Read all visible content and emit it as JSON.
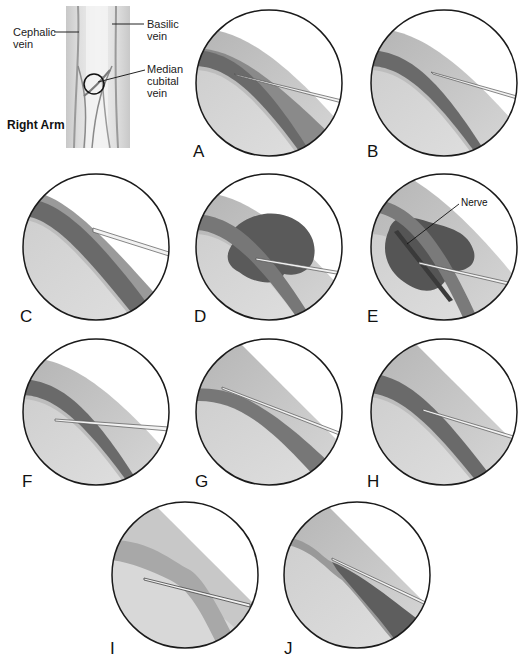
{
  "figure": {
    "arm_diagram": {
      "title": "Right Arm",
      "callouts": {
        "cephalic": "Cephalic\nvein",
        "cephalic_line1": "Cephalic",
        "cephalic_line2": "vein",
        "basilic_line1": "Basilic",
        "basilic_line2": "vein",
        "median_line1": "Median",
        "median_line2": "cubital",
        "median_line3": "vein"
      }
    },
    "panels": [
      {
        "id": "A",
        "label": "A",
        "description": "Needle bevel inside vein lumen"
      },
      {
        "id": "B",
        "label": "B",
        "description": "Needle short of vein, not entered"
      },
      {
        "id": "C",
        "label": "C",
        "description": "Needle resting against upper vein wall"
      },
      {
        "id": "D",
        "label": "D",
        "description": "Hematoma forming around vein"
      },
      {
        "id": "E",
        "label": "E",
        "description": "Hematoma with nerve involvement",
        "annotation": "Nerve"
      },
      {
        "id": "F",
        "label": "F",
        "description": "Needle passed beneath vein"
      },
      {
        "id": "G",
        "label": "G",
        "description": "Collapsed vein around needle"
      },
      {
        "id": "H",
        "label": "H",
        "description": "Needle bevel against lower vein wall"
      },
      {
        "id": "I",
        "label": "I",
        "description": "Needle misses vein, in tissue"
      },
      {
        "id": "J",
        "label": "J",
        "description": "Needle through vein, partial collapse"
      }
    ],
    "colors": {
      "background": "#ffffff",
      "tissue": "#d6d6d6",
      "tissue_light": "#e4e4e4",
      "vein": "#6e6e6e",
      "vein_wall": "#a9a9a9",
      "hematoma": "#5a5a5a",
      "needle": "#f0f0f0",
      "outline": "#1a1a1a"
    }
  }
}
